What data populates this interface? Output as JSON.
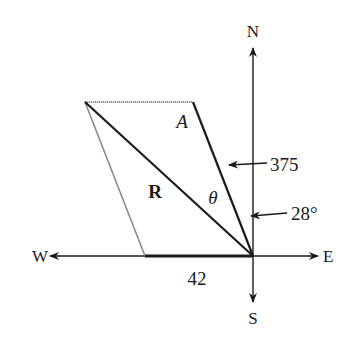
{
  "diagram": {
    "type": "vector-parallelogram",
    "compass": {
      "north": "N",
      "south": "S",
      "east": "E",
      "west": "W"
    },
    "labels": {
      "vector_a": "A",
      "resultant": "R",
      "angle": "θ",
      "magnitude_a": "375",
      "angle_a": "28°",
      "magnitude_b": "42"
    },
    "colors": {
      "line": "#1a1a1a",
      "construction_line": "#8a8a8a",
      "background": "#ffffff"
    }
  }
}
